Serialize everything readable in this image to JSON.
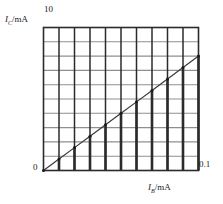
{
  "chart_data": {
    "type": "line",
    "title": "",
    "subtitle": "",
    "xlabel": "I_B/mA",
    "ylabel": "I_C/mA",
    "xlabel_symbol": "I",
    "xlabel_subscript": "B",
    "xlabel_unit": "/mA",
    "ylabel_symbol": "I",
    "ylabel_subscript": "C",
    "ylabel_unit": "/mA",
    "xlim": [
      0,
      0.1
    ],
    "ylim": [
      0,
      10
    ],
    "x_tick_labels": [
      "0",
      "0.1"
    ],
    "y_tick_labels": [
      "0",
      "10"
    ],
    "origin_label": "0",
    "x_max_label": "0.1",
    "y_max_label": "10",
    "grid": true,
    "grid_columns": 10,
    "grid_rows": 10,
    "legend": "none",
    "series": [
      {
        "name": "Ic vs Ib",
        "x": [
          0,
          0.01,
          0.02,
          0.03,
          0.04,
          0.05,
          0.06,
          0.07,
          0.08,
          0.09,
          0.1
        ],
        "values": [
          0,
          0.8,
          1.6,
          2.4,
          3.2,
          4.0,
          4.8,
          5.6,
          6.4,
          7.2,
          8.0
        ],
        "marker": "dot",
        "slope_beta": 80
      }
    ],
    "annotations": [
      "Straight line through origin from (0, 0) to (0.1, 8)"
    ],
    "colors": {
      "line": "#3a3a3a",
      "grid_vertical": "#2b2b2b",
      "grid_horizontal": "#8f8f8f",
      "frame": "#2b2b2b",
      "marker": "#1a1a1a",
      "text": "#1a1a1a",
      "background": "#ffffff"
    }
  }
}
